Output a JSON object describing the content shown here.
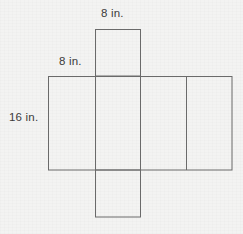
{
  "figure": {
    "background_color": "#f3f3f2",
    "line_color": "#6a6a6a",
    "text_color": "#3b3b3b",
    "labels": {
      "top_flap_width": "8 in.",
      "front_face_width": "8 in.",
      "front_face_height": "16 in."
    },
    "measurements": [
      {
        "name": "top-flap-width",
        "value": 8,
        "unit": "in."
      },
      {
        "name": "front-face-width",
        "value": 8,
        "unit": "in."
      },
      {
        "name": "front-face-height",
        "value": 16,
        "unit": "in."
      }
    ],
    "shapes": {
      "top_flap": {
        "x": 95,
        "y": 29,
        "width": 45,
        "height": 47
      },
      "main_band": {
        "x": 48,
        "y": 76,
        "width": 184,
        "height": 94
      },
      "bottom_flap": {
        "x": 95,
        "y": 170,
        "width": 45,
        "height": 47
      },
      "band_dividers_x": [
        95,
        140,
        187
      ]
    }
  }
}
